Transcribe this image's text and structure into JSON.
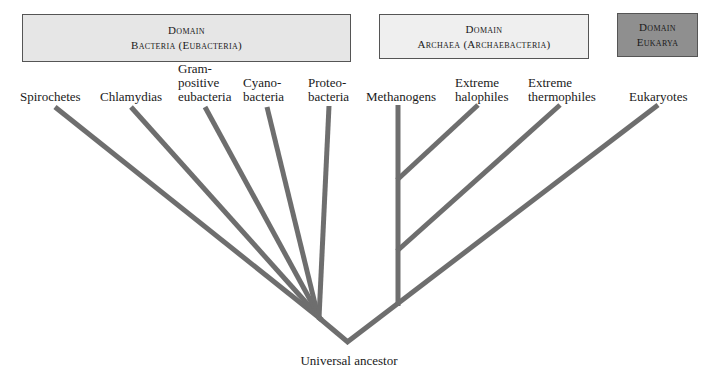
{
  "domains": {
    "bacteria": {
      "line1": "Domain",
      "line2": "Bacteria (Eubacteria)",
      "fill": "#e6e6e6"
    },
    "archaea": {
      "line1": "Domain",
      "line2": "Archaea (Archaebacteria)",
      "fill": "#efefef"
    },
    "eukarya": {
      "line1": "Domain",
      "line2": "Eukarya",
      "fill": "#8f8f8f"
    }
  },
  "taxa": [
    {
      "id": "spirochetes",
      "lines": [
        "Spirochetes"
      ],
      "domain": "bacteria"
    },
    {
      "id": "chlamydias",
      "lines": [
        "Chlamydias"
      ],
      "domain": "bacteria"
    },
    {
      "id": "gram-positive",
      "lines": [
        "Gram-",
        "positive",
        "eubacteria"
      ],
      "domain": "bacteria"
    },
    {
      "id": "cyanobacteria",
      "lines": [
        "Cyano-",
        "bacteria"
      ],
      "domain": "bacteria"
    },
    {
      "id": "proteobacteria",
      "lines": [
        "Proteo-",
        "bacteria"
      ],
      "domain": "bacteria"
    },
    {
      "id": "methanogens",
      "lines": [
        "Methanogens"
      ],
      "domain": "archaea"
    },
    {
      "id": "extreme-halophiles",
      "lines": [
        "Extreme",
        "halophiles"
      ],
      "domain": "archaea"
    },
    {
      "id": "extreme-thermophiles",
      "lines": [
        "Extreme",
        "thermophiles"
      ],
      "domain": "archaea"
    },
    {
      "id": "eukaryotes",
      "lines": [
        "Eukaryotes"
      ],
      "domain": "eukarya"
    }
  ],
  "root": {
    "label": "Universal ancestor"
  },
  "style": {
    "branch_color": "#6e6e6e",
    "branch_width": 5
  }
}
